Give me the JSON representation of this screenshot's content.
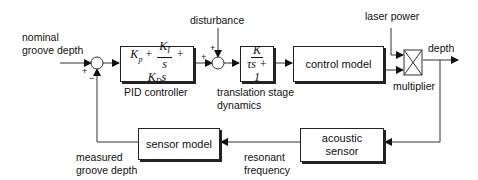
{
  "diagram": {
    "type": "control-loop block diagram",
    "inputs": {
      "nominal_line1": "nominal",
      "nominal_line2": "groove depth",
      "disturbance": "disturbance",
      "laser_power": "laser power"
    },
    "output": {
      "label": "depth"
    },
    "blocks": {
      "pid": {
        "label": "PID controller",
        "kp": "K",
        "kp_sub": "p",
        "ki": "K",
        "ki_sub": "I",
        "s": "s",
        "kd": "K",
        "kd_sub": "D",
        "kd_s": "s",
        "plus": "+"
      },
      "translation": {
        "label_line1": "translation stage",
        "label_line2": "dynamics",
        "num": "K",
        "den": "τs + 1"
      },
      "control_model": {
        "label": "control model"
      },
      "multiplier": {
        "label": "multiplier"
      },
      "acoustic_sensor": {
        "label_line1": "acoustic",
        "label_line2": "sensor"
      },
      "sensor_model": {
        "label": "sensor model"
      }
    },
    "signals": {
      "measured_line1": "measured",
      "measured_line2": "groove depth",
      "resonant_line1": "resonant",
      "resonant_line2": "frequency"
    },
    "signs": {
      "sum1_input": "+",
      "sum1_feedback": "−",
      "sum2_input": "+",
      "sum2_disturbance": "+"
    }
  }
}
